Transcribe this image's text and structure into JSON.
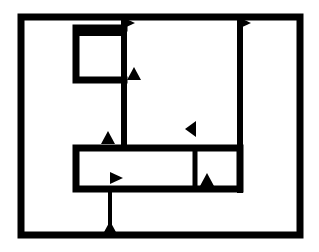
{
  "diagram": {
    "type": "block-flow-diagram",
    "canvas": {
      "width": 319,
      "height": 252,
      "background": "#ffffff"
    },
    "stroke_color": "#000000",
    "frame": {
      "x1": 21,
      "y1": 17,
      "x2": 300,
      "y2": 235,
      "stroke": 7
    },
    "wires": [
      {
        "id": "top-left-loop",
        "points": [
          [
            124,
            28
          ],
          [
            76,
            28
          ],
          [
            76,
            80
          ],
          [
            124,
            80
          ]
        ],
        "stroke": 7
      },
      {
        "id": "top-left-loop-inner-top",
        "points": [
          [
            76,
            33
          ],
          [
            124,
            33
          ]
        ],
        "stroke": 6
      },
      {
        "id": "vertical-left",
        "points": [
          [
            124,
            17
          ],
          [
            124,
            148
          ]
        ],
        "stroke": 6
      },
      {
        "id": "vertical-right",
        "points": [
          [
            240,
            17
          ],
          [
            240,
            190
          ]
        ],
        "stroke": 6
      },
      {
        "id": "bottom-box",
        "points": [
          [
            76,
            148
          ],
          [
            240,
            148
          ],
          [
            240,
            189
          ],
          [
            76,
            189
          ],
          [
            76,
            148
          ]
        ],
        "stroke": 7
      },
      {
        "id": "bottom-box-divider",
        "points": [
          [
            195,
            148
          ],
          [
            195,
            189
          ]
        ],
        "stroke": 5
      },
      {
        "id": "feed-down",
        "points": [
          [
            110,
            189
          ],
          [
            110,
            235
          ]
        ],
        "stroke": 4
      }
    ],
    "arrows": [
      {
        "id": "arrow-top-1",
        "x": 126,
        "y": 23,
        "dir": "right"
      },
      {
        "id": "arrow-top-2",
        "x": 242,
        "y": 23,
        "dir": "right"
      },
      {
        "id": "arrow-mid-up",
        "x": 134,
        "y": 74,
        "dir": "up"
      },
      {
        "id": "arrow-left-up",
        "x": 108,
        "y": 138,
        "dir": "up"
      },
      {
        "id": "arrow-right-left",
        "x": 192,
        "y": 129,
        "dir": "left"
      },
      {
        "id": "arrow-box-right",
        "x": 114,
        "y": 178,
        "dir": "right"
      },
      {
        "id": "arrow-box-up",
        "x": 207,
        "y": 180,
        "dir": "up"
      },
      {
        "id": "arrow-bottom-up",
        "x": 110,
        "y": 228,
        "dir": "up"
      }
    ]
  }
}
